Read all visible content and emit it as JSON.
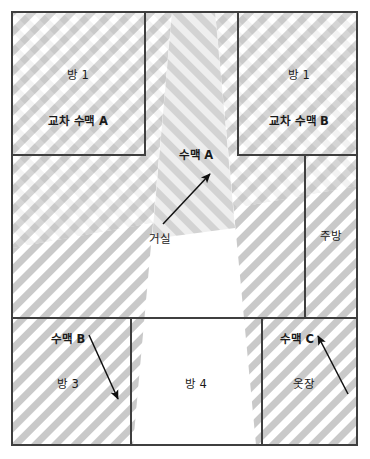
{
  "diagram": {
    "type": "floor-plan",
    "colors": {
      "frame_stroke": "#3a3a3a",
      "wall_stroke": "#444444",
      "base_fill": "#ffffff",
      "hatch_light": "#c9c9c9",
      "hatch_band_fill": "#dcdcdc",
      "overlap_fill": "#a8a8a8",
      "beam_fill": "#e6e6e6",
      "text": "#1a1a1a",
      "arrow": "#111111"
    }
  },
  "rooms": [
    {
      "id": "room-top-left",
      "name_label": "방 1",
      "vein_label": "교차 수맥 A",
      "name_x": 78,
      "name_y": 76,
      "vein_x": 78,
      "vein_y": 122
    },
    {
      "id": "room-top-right",
      "name_label": "방 1",
      "vein_label": "교차 수맥 B",
      "name_x": 299,
      "name_y": 76,
      "vein_x": 299,
      "vein_y": 122
    },
    {
      "id": "room-kitchen",
      "name_label": "주방",
      "name_x": 331,
      "name_y": 237
    },
    {
      "id": "room-living",
      "name_label": "거실",
      "name_x": 160,
      "name_y": 240
    },
    {
      "id": "room-bottom-left",
      "name_label": "방 3",
      "vein_label": "수맥 B",
      "name_x": 68,
      "name_y": 385,
      "vein_x": 68,
      "vein_y": 340
    },
    {
      "id": "room-bottom-center",
      "name_label": "방 4",
      "name_x": 196,
      "name_y": 385
    },
    {
      "id": "room-bottom-right",
      "name_label": "옷장",
      "vein_label": "수맥 C",
      "name_x": 304,
      "name_y": 385,
      "vein_x": 297,
      "vein_y": 340
    }
  ],
  "veins": [
    {
      "id": "vein-a",
      "label": "수맥 A",
      "label_x": 196,
      "label_y": 156,
      "arrow": {
        "x1": 163,
        "y1": 224,
        "x2": 210,
        "y2": 174
      }
    },
    {
      "id": "vein-b",
      "label": "수맥 B",
      "arrow": {
        "x1": 89,
        "y1": 335,
        "x2": 118,
        "y2": 399
      }
    },
    {
      "id": "vein-c",
      "label": "수맥 C",
      "arrow": {
        "x1": 348,
        "y1": 394,
        "x2": 318,
        "y2": 336
      }
    }
  ]
}
